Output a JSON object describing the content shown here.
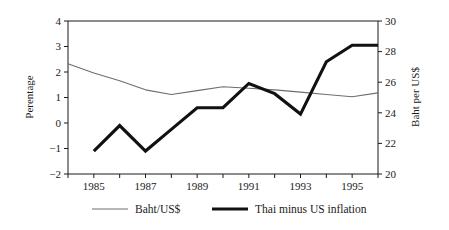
{
  "chart_data": {
    "type": "line",
    "title": "",
    "xlabel": "",
    "ylabel": "Perentage",
    "y2label": "Baht per US$",
    "grid": false,
    "legend_position": "bottom",
    "x": [
      1984,
      1985,
      1986,
      1987,
      1988,
      1989,
      1990,
      1991,
      1992,
      1993,
      1994,
      1995,
      1996
    ],
    "xlim": [
      1984,
      1996
    ],
    "xticks": [
      1984,
      1985,
      1986,
      1987,
      1988,
      1989,
      1990,
      1991,
      1992,
      1993,
      1994,
      1995,
      1996
    ],
    "xticklabels": [
      "",
      "1985",
      "",
      "1987",
      "",
      "1989",
      "",
      "1991",
      "",
      "1993",
      "",
      "1995",
      ""
    ],
    "ylim": [
      -2,
      4
    ],
    "yticks": [
      -2,
      -1,
      0,
      1,
      2,
      3,
      4
    ],
    "yticklabels": [
      "−2",
      "−1",
      "0",
      "1",
      "2",
      "3",
      "4"
    ],
    "y2lim": [
      20,
      30
    ],
    "y2ticks": [
      20,
      22,
      24,
      26,
      28,
      30
    ],
    "y2ticklabels": [
      "20",
      "22",
      "24",
      "26",
      "28",
      "30"
    ],
    "series": [
      {
        "name": "Baht/US$",
        "axis": "right",
        "style": "thin",
        "color": "#6e6e6e",
        "x": [
          1984,
          1985,
          1986,
          1987,
          1988,
          1989,
          1990,
          1991,
          1992,
          1993,
          1994,
          1995,
          1996
        ],
        "values": [
          27.2,
          26.6,
          26.1,
          25.5,
          25.2,
          25.45,
          25.7,
          25.6,
          25.5,
          25.35,
          25.2,
          25.05,
          25.3
        ]
      },
      {
        "name": "Thai minus US inflation",
        "axis": "left",
        "style": "thick",
        "color": "#111111",
        "x": [
          1985,
          1986,
          1987,
          1988,
          1989,
          1990,
          1991,
          1992,
          1993,
          1994,
          1995,
          1996
        ],
        "values": [
          -1.1,
          -0.1,
          -1.1,
          -0.25,
          0.6,
          0.6,
          1.55,
          1.15,
          0.35,
          2.4,
          3.05,
          3.05
        ]
      }
    ],
    "legend": [
      {
        "label": "Baht/US$",
        "style": "thin",
        "color": "#6e6e6e"
      },
      {
        "label": "Thai minus US inflation",
        "style": "thick",
        "color": "#111111"
      }
    ]
  }
}
